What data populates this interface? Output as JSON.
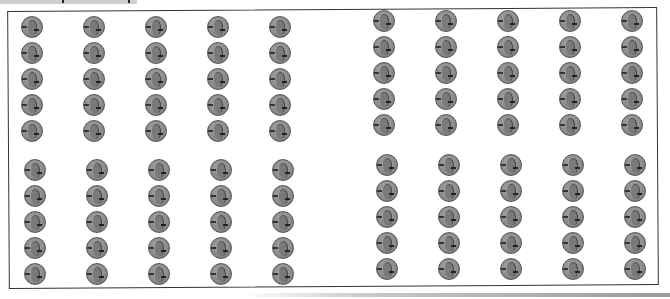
{
  "header": {
    "note": ""
  },
  "worksheet": {
    "coin_type": "penny-icon",
    "coin_value_cents": 1,
    "total_coins": 100,
    "blocks": [
      {
        "id": "top-left",
        "rows": 5,
        "cols": 5,
        "count": 25
      },
      {
        "id": "top-right",
        "rows": 5,
        "cols": 5,
        "count": 25
      },
      {
        "id": "bottom-left",
        "rows": 5,
        "cols": 5,
        "count": 25
      },
      {
        "id": "bottom-right",
        "rows": 5,
        "cols": 5,
        "count": 25
      }
    ]
  },
  "colors": {
    "coin": "#8c8c8c",
    "coin_edge": "#555555",
    "frame": "#333333",
    "strip": "#cfcfcf"
  }
}
